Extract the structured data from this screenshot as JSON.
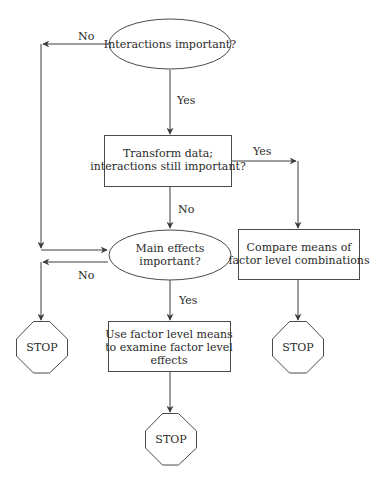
{
  "colors": {
    "stroke": "#4a4a4a",
    "text": "#2a2a2a",
    "background": "#ffffff"
  },
  "nodes": {
    "interactions": {
      "type": "decision-ellipse",
      "lines": [
        "Interactions important?"
      ]
    },
    "transform": {
      "type": "process-box",
      "lines": [
        "Transform data;",
        "interactions still important?"
      ]
    },
    "main_effects": {
      "type": "decision-ellipse",
      "lines": [
        "Main effects",
        "important?"
      ]
    },
    "compare": {
      "type": "process-box",
      "lines": [
        "Compare means of",
        "factor level combinations"
      ]
    },
    "use_means": {
      "type": "process-box",
      "lines": [
        "Use factor level means",
        "to examine factor level",
        "effects"
      ]
    },
    "stop_left": {
      "type": "terminal-octagon",
      "lines": [
        "STOP"
      ]
    },
    "stop_bottom": {
      "type": "terminal-octagon",
      "lines": [
        "STOP"
      ]
    },
    "stop_right": {
      "type": "terminal-octagon",
      "lines": [
        "STOP"
      ]
    }
  },
  "edges": {
    "interactions_no": {
      "from": "interactions",
      "to": "main_effects",
      "label": "No"
    },
    "interactions_yes": {
      "from": "interactions",
      "to": "transform",
      "label": "Yes"
    },
    "transform_yes": {
      "from": "transform",
      "to": "compare",
      "label": "Yes"
    },
    "transform_no": {
      "from": "transform",
      "to": "main_effects",
      "label": "No"
    },
    "main_effects_no": {
      "from": "main_effects",
      "to": "stop_left",
      "label": "No"
    },
    "main_effects_yes": {
      "from": "main_effects",
      "to": "use_means",
      "label": "Yes"
    },
    "compare_stop": {
      "from": "compare",
      "to": "stop_right",
      "label": ""
    },
    "use_means_stop": {
      "from": "use_means",
      "to": "stop_bottom",
      "label": ""
    }
  }
}
